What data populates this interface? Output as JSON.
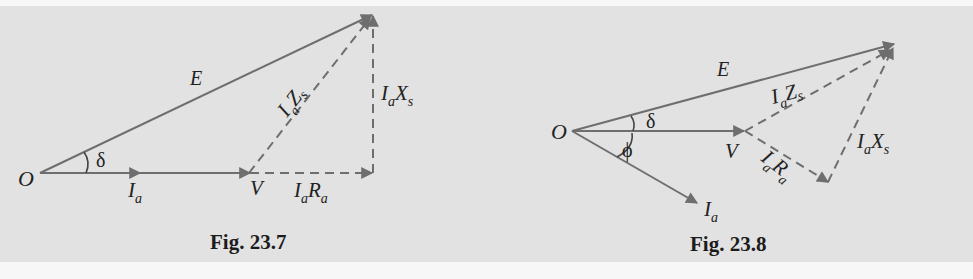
{
  "colors": {
    "page_background": "#f7f7f7",
    "panel_background": "#e2e2e2",
    "vector_line": "#6e6e6e",
    "text": "#222222"
  },
  "figures": [
    {
      "caption": "Fig. 23.7",
      "labels": {
        "origin": "O",
        "emf": "E",
        "delta": "δ",
        "current_main": "I",
        "current_sub": "a",
        "voltage": "V",
        "resistive_drop_main1": "I",
        "resistive_drop_sub1": "a",
        "resistive_drop_main2": "R",
        "resistive_drop_sub2": "a",
        "impedance_drop_main1": "I",
        "impedance_drop_sub1": "a",
        "impedance_drop_main2": "Z",
        "impedance_drop_sub2": "s",
        "reactive_drop_main1": "I",
        "reactive_drop_sub1": "a",
        "reactive_drop_main2": "X",
        "reactive_drop_sub2": "s"
      }
    },
    {
      "caption": "Fig. 23.8",
      "labels": {
        "origin": "O",
        "emf": "E",
        "delta": "δ",
        "phi": "ϕ",
        "current_main": "I",
        "current_sub": "a",
        "voltage": "V",
        "resistive_drop_main1": "I",
        "resistive_drop_sub1": "a",
        "resistive_drop_main2": "R",
        "resistive_drop_sub2": "a",
        "impedance_drop_main1": "I",
        "impedance_drop_sub1": "a",
        "impedance_drop_main2": "Z",
        "impedance_drop_sub2": "s",
        "reactive_drop_main1": "I",
        "reactive_drop_sub1": "a",
        "reactive_drop_main2": "X",
        "reactive_drop_sub2": "s"
      }
    }
  ]
}
